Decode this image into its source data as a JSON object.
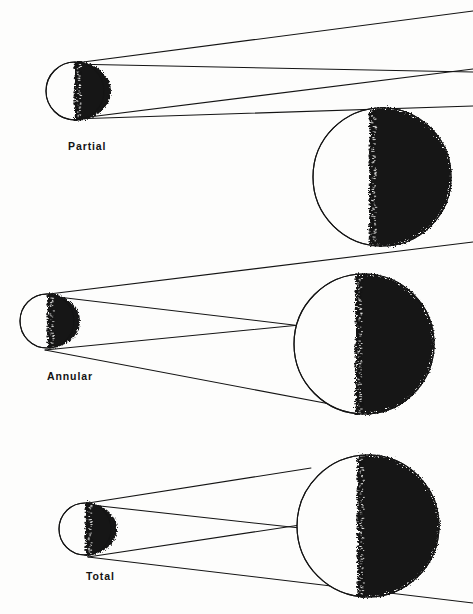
{
  "figure": {
    "background_color": "#fdfdfc",
    "ink_color": "#141414",
    "width": 473,
    "height": 614
  },
  "panels": [
    {
      "id": "partial",
      "label": "Partial",
      "label_x": 68,
      "label_y": 150,
      "moon": {
        "name": "moon-body",
        "cx": 75,
        "cy": 91,
        "r": 29,
        "terminator_x": 75,
        "lit_side": "left",
        "shadow_side": "right",
        "shadow_bulge": 9
      },
      "earth": {
        "name": "earth-body",
        "cx": 382,
        "cy": 177,
        "r": 69,
        "terminator_x": 370,
        "lit_side": "left",
        "shadow_side": "right"
      },
      "rays": [
        {
          "name": "ray-upper",
          "x1": 68,
          "y1": 64,
          "x2": 473,
          "y2": 11
        },
        {
          "name": "ray-mid",
          "x1": 68,
          "y1": 64,
          "x2": 473,
          "y2": 72
        },
        {
          "name": "ray-lower-a",
          "x1": 73,
          "y1": 119,
          "x2": 473,
          "y2": 69
        },
        {
          "name": "ray-lower-b",
          "x1": 73,
          "y1": 119,
          "x2": 473,
          "y2": 106
        }
      ],
      "crossing": {
        "x": 301,
        "y": 90
      }
    },
    {
      "id": "annular",
      "label": "Annular",
      "label_x": 47,
      "label_y": 380,
      "moon": {
        "name": "moon-body",
        "cx": 47,
        "cy": 321,
        "r": 27,
        "terminator_x": 48,
        "lit_side": "left",
        "shadow_side": "right",
        "shadow_bulge": 8
      },
      "earth": {
        "name": "earth-body",
        "cx": 364,
        "cy": 344,
        "r": 70,
        "terminator_x": 356,
        "lit_side": "left",
        "shadow_side": "right"
      },
      "rays": [
        {
          "name": "ray-upper",
          "x1": 41,
          "y1": 295,
          "x2": 473,
          "y2": 242
        },
        {
          "name": "ray-upper-tangent",
          "x1": 41,
          "y1": 295,
          "x2": 310,
          "y2": 327
        },
        {
          "name": "ray-lower-tangent",
          "x1": 45,
          "y1": 350,
          "x2": 310,
          "y2": 324
        },
        {
          "name": "ray-lower",
          "x1": 45,
          "y1": 350,
          "x2": 330,
          "y2": 404
        }
      ],
      "crossing": {
        "x": 296,
        "y": 326
      }
    },
    {
      "id": "total",
      "label": "Total",
      "label_x": 86,
      "label_y": 580,
      "moon": {
        "name": "moon-body",
        "cx": 85,
        "cy": 529,
        "r": 26,
        "terminator_x": 86,
        "lit_side": "left",
        "shadow_side": "right",
        "shadow_bulge": 8
      },
      "earth": {
        "name": "earth-body",
        "cx": 368,
        "cy": 526,
        "r": 71,
        "terminator_x": 358,
        "lit_side": "left",
        "shadow_side": "right"
      },
      "rays": [
        {
          "name": "ray-upper",
          "x1": 82,
          "y1": 504,
          "x2": 311,
          "y2": 468
        },
        {
          "name": "ray-upper-tangent",
          "x1": 82,
          "y1": 504,
          "x2": 300,
          "y2": 528
        },
        {
          "name": "ray-lower-tangent",
          "x1": 88,
          "y1": 557,
          "x2": 300,
          "y2": 525
        },
        {
          "name": "ray-lower",
          "x1": 88,
          "y1": 557,
          "x2": 473,
          "y2": 603
        }
      ],
      "crossing": {
        "x": 298,
        "y": 527
      }
    }
  ]
}
